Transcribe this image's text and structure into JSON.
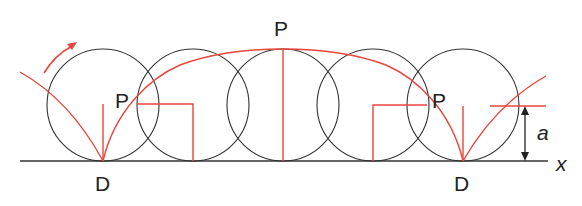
{
  "diagram": {
    "type": "cycloid",
    "colors": {
      "curve": "#e8453c",
      "circle": "#333333",
      "baseline": "#333333",
      "text": "#222222"
    },
    "labels": {
      "point_top": "P",
      "point_left": "P",
      "point_right": "P",
      "contact_left": "D",
      "contact_right": "D",
      "radius": "a",
      "axis": "x"
    },
    "circles": [
      {
        "cx": 103,
        "cy": 105,
        "r": 56
      },
      {
        "cx": 193,
        "cy": 105,
        "r": 56
      },
      {
        "cx": 283,
        "cy": 105,
        "r": 56
      },
      {
        "cx": 373,
        "cy": 105,
        "r": 56
      },
      {
        "cx": 463,
        "cy": 105,
        "r": 56
      }
    ],
    "rotation_arrow": "clockwise"
  }
}
